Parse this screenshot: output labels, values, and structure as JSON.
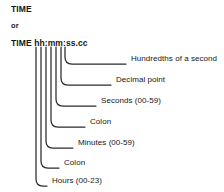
{
  "diagram": {
    "type": "syntax-callout-diagram",
    "background_color": "#ffffff",
    "line_color": "#2b2b2b",
    "text_color": "#161616",
    "syntax": {
      "line1": "TIME",
      "line2": "or",
      "line3": "TIME hh:mm:ss.cc"
    },
    "callouts": [
      {
        "id": "hundredths",
        "label": "Hundredths of a second",
        "token": "cc",
        "label_x": 131,
        "label_y": 58,
        "leader_start_x": 65,
        "leader_end_x": 126,
        "corner_y": 64
      },
      {
        "id": "decimal-point",
        "label": "Decimal point",
        "token": ".",
        "label_x": 116,
        "label_y": 79,
        "leader_start_x": 61,
        "leader_end_x": 111,
        "corner_y": 85
      },
      {
        "id": "seconds",
        "label": "Seconds (00-59)",
        "token": "ss",
        "label_x": 101,
        "label_y": 100,
        "leader_start_x": 56,
        "leader_end_x": 96,
        "corner_y": 106
      },
      {
        "id": "colon-2",
        "label": "Colon",
        "token": ":",
        "label_x": 90,
        "label_y": 121,
        "leader_start_x": 51,
        "leader_end_x": 85,
        "corner_y": 127
      },
      {
        "id": "minutes",
        "label": "Minutes (00-59)",
        "token": "mm",
        "label_x": 78,
        "label_y": 142,
        "leader_start_x": 46,
        "leader_end_x": 73,
        "corner_y": 148
      },
      {
        "id": "colon-1",
        "label": "Colon",
        "token": ":",
        "label_x": 64,
        "label_y": 162,
        "leader_start_x": 41,
        "leader_end_x": 59,
        "corner_y": 168
      },
      {
        "id": "hours",
        "label": "Hours (00-23)",
        "token": "hh",
        "label_x": 52,
        "label_y": 180,
        "leader_start_x": 36,
        "leader_end_x": 47,
        "corner_y": 186
      }
    ]
  }
}
